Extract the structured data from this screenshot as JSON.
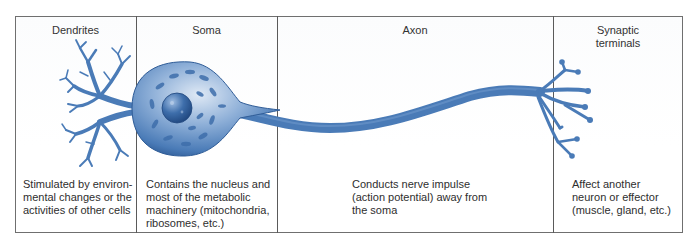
{
  "figure": {
    "type": "neuron-anatomy-diagram",
    "colors": {
      "neuron_fill": "#4a7bb7",
      "neuron_dark": "#2f5c97",
      "soma_light": "#c9daef",
      "nucleus": "#2d5a96",
      "border": "#5a5a5a",
      "text": "#2e2e2e"
    },
    "sections": [
      {
        "id": "dendrites",
        "header": "Dendrites",
        "description": "Stimulated by environ-\nmental changes or the\nactivities of other cells"
      },
      {
        "id": "soma",
        "header": "Soma",
        "description": "Contains the nucleus and\nmost of the metabolic\nmachinery (mitochondria,\nribosomes, etc.)"
      },
      {
        "id": "axon",
        "header": "Axon",
        "description": "Conducts nerve impulse\n(action potential) away from\nthe soma"
      },
      {
        "id": "synaptic-terminals",
        "header": "Synaptic\nterminals",
        "description": "Affect another\nneuron or effector\n(muscle, gland, etc.)"
      }
    ]
  }
}
